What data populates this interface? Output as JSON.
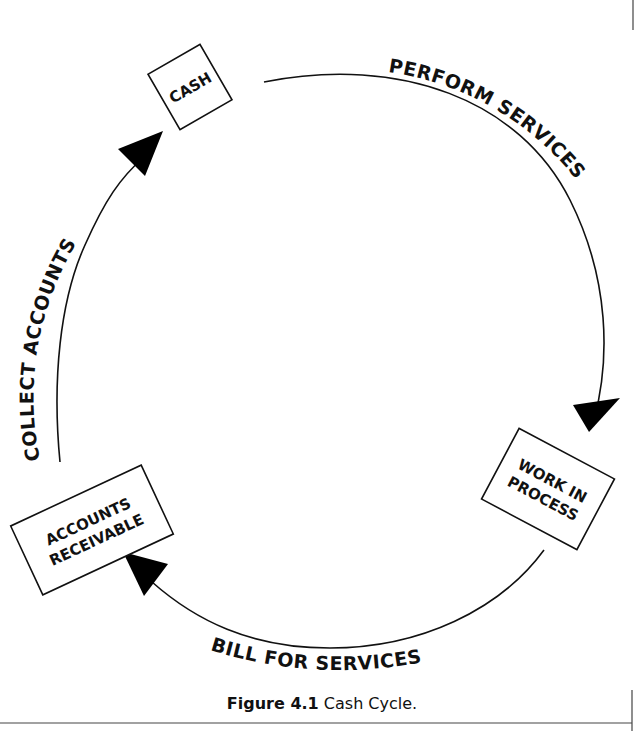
{
  "figure": {
    "title": "Cash Cycle",
    "caption_label": "Figure 4.1",
    "caption_text": "Cash Cycle."
  },
  "nodes": [
    {
      "id": "cash",
      "lines": [
        "CASH"
      ]
    },
    {
      "id": "work_in_process",
      "lines": [
        "WORK IN",
        "PROCESS"
      ]
    },
    {
      "id": "accounts_receivable",
      "lines": [
        "ACCOUNTS",
        "RECEIVABLE"
      ]
    }
  ],
  "edges": [
    {
      "from": "cash",
      "to": "work_in_process",
      "label": "PERFORM SERVICES"
    },
    {
      "from": "work_in_process",
      "to": "accounts_receivable",
      "label": "BILL FOR SERVICES"
    },
    {
      "from": "accounts_receivable",
      "to": "cash",
      "label": "COLLECT ACCOUNTS"
    }
  ],
  "colors": {
    "stroke": "#111111",
    "background": "#ffffff"
  }
}
